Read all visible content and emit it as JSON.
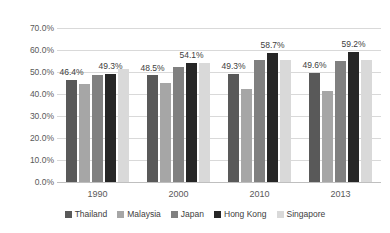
{
  "chart_data": {
    "type": "bar",
    "title": "",
    "subtitle": "",
    "xlabel": "",
    "ylabel": "",
    "categories": [
      "1990",
      "2000",
      "2010",
      "2013"
    ],
    "ylim": [
      0,
      70
    ],
    "ytick_labels": [
      "0.0%",
      "10.0%",
      "20.0%",
      "30.0%",
      "40.0%",
      "50.0%",
      "60.0%",
      "70.0%"
    ],
    "ytick_values": [
      0,
      10,
      20,
      30,
      40,
      50,
      60,
      70
    ],
    "grid": true,
    "legend_position": "bottom",
    "value_suffix": "%",
    "series": [
      {
        "name": "Thailand",
        "color": "#595959",
        "values": [
          46.4,
          48.5,
          49.3,
          49.6
        ],
        "labels": [
          "46.4%",
          "48.5%",
          "49.3%",
          "49.6%"
        ]
      },
      {
        "name": "Malaysia",
        "color": "#a6a6a6",
        "values": [
          44.5,
          45.0,
          42.5,
          41.5
        ],
        "labels": [
          "",
          "",
          "",
          ""
        ]
      },
      {
        "name": "Japan",
        "color": "#808080",
        "values": [
          48.8,
          52.5,
          55.5,
          55.0
        ],
        "labels": [
          "",
          "",
          "",
          ""
        ]
      },
      {
        "name": "Hong Kong",
        "color": "#262626",
        "values": [
          49.3,
          54.1,
          58.7,
          59.2
        ],
        "labels": [
          "49.3%",
          "54.1%",
          "58.7%",
          "59.2%"
        ]
      },
      {
        "name": "Singapore",
        "color": "#d9d9d9",
        "values": [
          51.5,
          54.0,
          55.5,
          55.5
        ],
        "labels": [
          "",
          "",
          "",
          ""
        ]
      }
    ]
  }
}
